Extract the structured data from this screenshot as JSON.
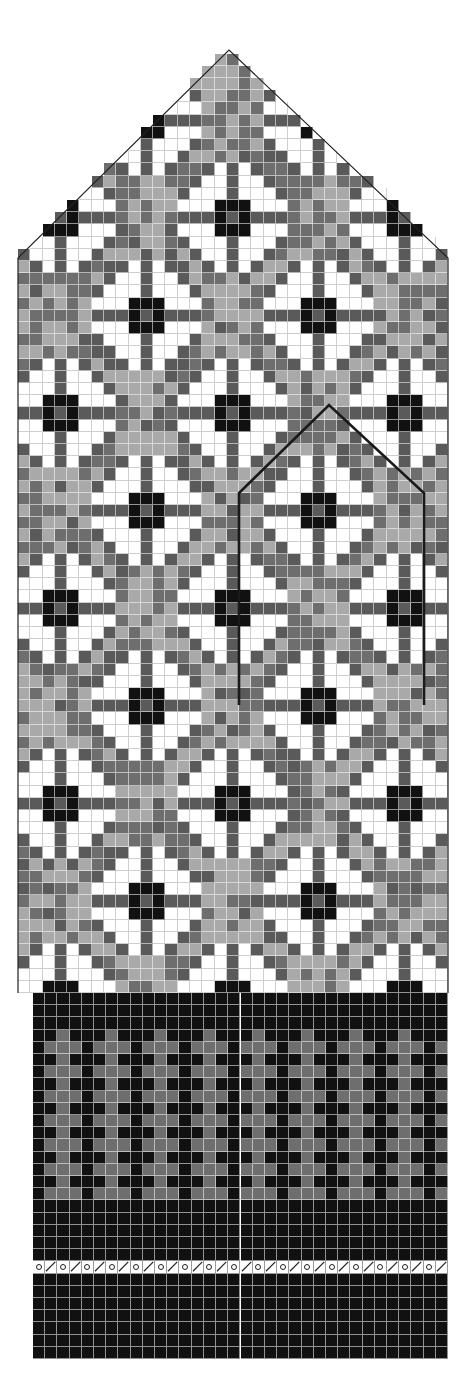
{
  "chart_title": "",
  "colors": {
    "white": "#ffffff",
    "light_gray": "#a9a9a9",
    "mid_gray": "#6e6e6e",
    "dark_gray": "#5a5a5a",
    "black": "#111111",
    "outline": "#222222",
    "thumb_outline": "#1a1a1a"
  },
  "grid": {
    "cell_w": 12.3,
    "cell_h": 12.2
  },
  "body": {
    "left_x": 18,
    "right_x": 448,
    "top_y": 258,
    "bottom_y": 993,
    "cols": 35,
    "apex": {
      "x": 229,
      "y": 50
    },
    "motif": {
      "name": "eight-petal-rose",
      "repeat_cols": 14,
      "repeat_rows": 15,
      "centers": [
        {
          "col": 3,
          "row": 13
        },
        {
          "col": 17,
          "row": 13
        },
        {
          "col": 31,
          "row": 13
        },
        {
          "col": 10,
          "row": 5
        },
        {
          "col": 24,
          "row": 5
        },
        {
          "col": 10,
          "row": 21
        },
        {
          "col": 24,
          "row": 21
        },
        {
          "col": 3,
          "row": 29
        },
        {
          "col": 17,
          "row": 29
        },
        {
          "col": 31,
          "row": 29
        },
        {
          "col": 10,
          "row": 37
        },
        {
          "col": 24,
          "row": 37
        },
        {
          "col": 3,
          "row": 45
        },
        {
          "col": 17,
          "row": 45
        },
        {
          "col": 31,
          "row": 45
        },
        {
          "col": 10,
          "row": 53
        },
        {
          "col": 24,
          "row": 53
        },
        {
          "col": 3,
          "row": 61
        },
        {
          "col": 17,
          "row": 61
        },
        {
          "col": 31,
          "row": 61
        },
        {
          "col": 10,
          "row": 69
        },
        {
          "col": 24,
          "row": 69
        },
        {
          "col": 3,
          "row": 77
        },
        {
          "col": 17,
          "row": 77
        },
        {
          "col": 31,
          "row": 77
        }
      ]
    }
  },
  "thumb_outline": {
    "points": [
      [
        239,
        705
      ],
      [
        239,
        493
      ],
      [
        329,
        405
      ],
      [
        424,
        493
      ],
      [
        424,
        705
      ]
    ]
  },
  "cuff": {
    "left_x": 33,
    "right_x": 448,
    "top_y": 993,
    "cols": 34,
    "rows": [
      "KKKKKKKKKKKKKKKKKKKKKKKKKKKKKKKKKK",
      "KKKKKKKKKKKKKKKKKKKKKKKKKKKKKKKKKK",
      "KKKKKKKKKKKKKKKKKKKKKKKKKKKKKKKKKK",
      "KKGKKKGKKKGKKKGKKKGKKKGKKKGKKKGKKK",
      "KGGGKGGGKGGGKGGGKGGGKGGGKGGGKGGGKG",
      "KKGKKKGKKKGKKKGKKKGKKKGKKKGKKKGKKK",
      "KGGGKGGGKGGGKGGGKGGGKGGGKGGGKGGGKG",
      "KKGKKKGKKKGKKKGKKKGKKKGKKKGKKKGKKK",
      "KGGGKGGGKGGGKGGGKGGGKGGGKGGGKGGGKG",
      "KKGKKKGKKKGKKKGKKKGKKKGKKKGKKKGKKK",
      "KGGGKGGGKGGGKGGGKGGGKGGGKGGGKGGGKG",
      "KKGKKKGKKKGKKKGKKKGKKKGKKKGKKKGKKK",
      "KGGGKGGGKGGGKGGGKGGGKGGGKGGGKGGGKG",
      "KKGKKKGKKKGKKKGKKKGKKKGKKKGKKKGKKK",
      "KGGGKGGGKGGGKGGGKGGGKGGGKGGGKGGGKG",
      "KKGKKKGKKKGKKKGKKKGKKKGKKKGKKKGKKK",
      "KGGGKGGGKGGGKGGGKGGGKGGGKGGGKGGGKG",
      "KKKKKKKKKKKKKKKKKKKKKKKKKKKKKKKKKK",
      "KKKKKKKKKKKKKKKKKKKKKKKKKKKKKKKKKK",
      "KKKKKKKKKKKKKKKKKKKKKKKKKKKKKKKKKK",
      "KKKKKKKKKKKKKKKKKKKKKKKKKKKKKKKKKK",
      "KKKKKKKKKKKKKKKKKKKKKKKKKKKKKKKKKK",
      "OSOSOSOSOSOSOSOSOSOSOSOSOSOSOSOSOS",
      "KKKKKKKKKKKKKKKKKKKKKKKKKKKKKKKKKK",
      "KKKKKKKKKKKKKKKKKKKKKKKKKKKKKKKKKK",
      "KKKKKKKKKKKKKKKKKKKKKKKKKKKKKKKKKK",
      "KKKKKKKKKKKKKKKKKKKKKKKKKKKKKKKKKK",
      "KKKKKKKKKKKKKKKKKKKKKKKKKKKKKKKKKK",
      "KKKKKKKKKKKKKKKKKKKKKKKKKKKKKKKKKK",
      "KKKKKKKKKKKKKKKKKKKKKKKKKKKKKKKKKK"
    ],
    "legend": {
      "K": "black",
      "G": "mid_gray",
      "O": "yarn-over",
      "S": "k2tog"
    }
  },
  "symbols": {
    "yarn_over": "o",
    "k2tog": "/"
  }
}
